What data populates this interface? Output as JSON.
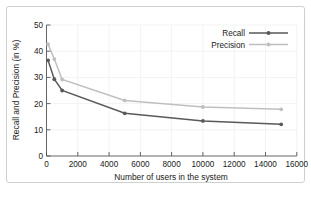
{
  "chart_data": {
    "type": "line",
    "title": "",
    "xlabel": "Number of users in the system",
    "ylabel": "Recall and Precision (in %)",
    "xlim": [
      0,
      16000
    ],
    "ylim": [
      0,
      50
    ],
    "xticks": [
      0,
      2000,
      4000,
      6000,
      8000,
      10000,
      12000,
      14000,
      16000
    ],
    "xtick_labels": [
      "0",
      "2000",
      "4000",
      "6000",
      "8000",
      "10000",
      "12000",
      "14000",
      "16000"
    ],
    "yticks": [
      0,
      10,
      20,
      30,
      40,
      50
    ],
    "ytick_labels": [
      "0",
      "10",
      "20",
      "30",
      "40",
      "50"
    ],
    "grid": true,
    "legend_position": "top-right",
    "x": [
      100,
      500,
      1000,
      5000,
      10000,
      15000
    ],
    "series": [
      {
        "name": "Recall",
        "color": "#595959",
        "marker": "point",
        "values": [
          36.5,
          29.3,
          25.0,
          16.3,
          13.4,
          12.1
        ]
      },
      {
        "name": "Precision",
        "color": "#bfbfbf",
        "marker": "point",
        "values": [
          42.7,
          37.0,
          29.2,
          21.2,
          18.7,
          17.8
        ]
      }
    ]
  },
  "legend": {
    "entries": [
      {
        "label": "Recall"
      },
      {
        "label": "Precision"
      }
    ]
  },
  "colors": {
    "recall": "#595959",
    "precision": "#bfbfbf",
    "axis": "#555555",
    "grid": "#eeeeee",
    "frame_border": "#cfcfcf",
    "text": "#1a1a1a"
  }
}
